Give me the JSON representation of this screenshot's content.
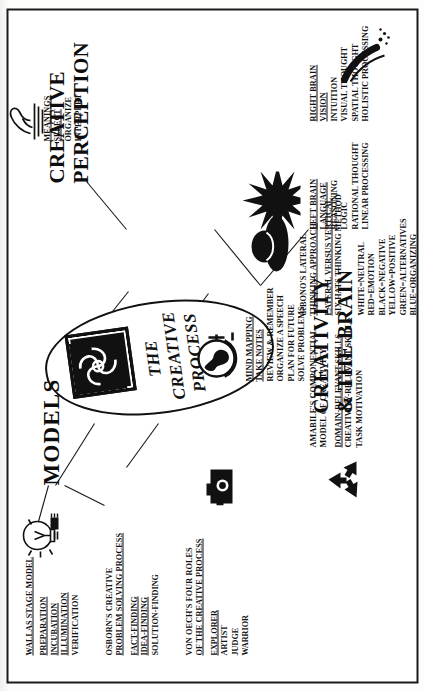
{
  "poster": {
    "center": {
      "line1": "THE",
      "line2": "CREATIVE",
      "line3": "PROCESS",
      "icon": "celtic-knot-icon"
    },
    "section_models_word": "MODELS",
    "sections": [
      {
        "id": "creativity-and-the-brain",
        "title_line1": "CREATIVITY",
        "title_line2": "& THE BRAIN"
      },
      {
        "id": "creative-perception",
        "title_line1": "CREATIVE",
        "title_line2": "PERCEPTION"
      }
    ],
    "blocks": [
      {
        "id": "wallas-stage-model",
        "icon": "lightbulb-icon",
        "heading": "WALLAS STAGE MODEL",
        "items": [
          "PREPARATION",
          "INCUBATION",
          "ILLUMINATION",
          "VERIFICATION"
        ],
        "underlined_items": [
          0,
          1,
          2
        ]
      },
      {
        "id": "osborn-creative-problem-solving",
        "heading_line1": "OSBORN'S CREATIVE",
        "heading_line2": "PROBLEM SOLVING PROCESS",
        "items": [
          "FACT-FINDING",
          "IDEA-FINDING",
          "SOLUTION-FINDING"
        ],
        "underlined_items": [
          0,
          1
        ]
      },
      {
        "id": "von-oech-four-roles",
        "icon": "camera-icon",
        "heading_line1": "VON OECH'S FOUR ROLES",
        "heading_line2": "OF THE CREATIVE PROCESS",
        "items": [
          "EXPLORER",
          "ARTIST",
          "JUDGE",
          "WARRIOR"
        ],
        "underlined_items": [
          0
        ]
      },
      {
        "id": "amabile-componential-model",
        "icon": "recycle-icon",
        "heading_line1": "AMABILE'S COMPONENTIAL",
        "heading_line2": "MODEL OF CREATIVITY",
        "items": [
          "DOMAIN-RELEVANT SKILLS",
          "CREATIVITY-RELEVANT SKILLS",
          "TASK MOTIVATION"
        ],
        "underlined_items": [
          0
        ]
      },
      {
        "id": "debono-lateral-thinking",
        "icon": "black-hat-icon",
        "heading_line1": "deBONO'S LATERAL",
        "heading_line2": "THINKING APPROACH",
        "items": [
          "LATERAL VERSUS VERTICAL",
          "SIX HATS THINKING METHOD"
        ],
        "underlined_items": [
          0
        ]
      },
      {
        "id": "six-hats-colors",
        "items": [
          "WHITE=NEUTRAL",
          "RED=EMOTION",
          "BLACK=NEGATIVE",
          "YELLOW=POSITIVE",
          "GREEN=ALTERNATIVES",
          "BLUE=ORGANIZING"
        ],
        "underlined_items": []
      },
      {
        "id": "mind-mapping",
        "icon": "globe-icon",
        "heading": "MIND MAPPING",
        "items": [
          "TAKE NOTES",
          "REVIEW & REMEMBER",
          "ORGANIZE A SPEECH",
          "PLAN FOR FUTURE",
          "SOLVE PROBLEMS"
        ],
        "underlined_items": [
          0
        ]
      },
      {
        "id": "meanings",
        "icon": "hand-sculpture-icon",
        "heading": "MEANINGS",
        "items": [
          "SELECT",
          "ORGANIZE",
          "INTERPRET"
        ],
        "underlined_items": [
          0
        ]
      },
      {
        "id": "left-brain",
        "icon": "starburst-icon",
        "heading": "LEFT BRAIN",
        "items": [
          "LANGUAGE",
          "REASONING",
          "LOGIC",
          "RATIONAL THOUGHT",
          "LINEAR PROCESSING"
        ],
        "underlined_items": [
          0
        ]
      },
      {
        "id": "right-brain",
        "heading": "RIGHT BRAIN",
        "items": [
          "VISION",
          "INTUITION",
          "VISUAL THOUGHT",
          "SPATIAL THOUGHT",
          "HOLISTIC PROCESSING"
        ],
        "underlined_items": []
      }
    ]
  },
  "colors": {
    "ink": "#111111",
    "paper": "#ffffff",
    "scan_background": "#fbfbfa"
  }
}
